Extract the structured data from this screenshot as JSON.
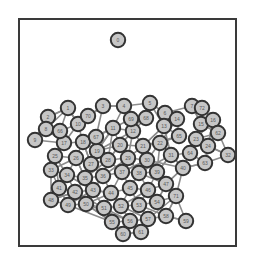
{
  "figure": {
    "type": "network-graph",
    "title": "",
    "background_color": "#ffffff",
    "frame": {
      "name": "plot-border",
      "x": 19,
      "y": 19,
      "width": 217,
      "height": 227,
      "stroke_color": "#3a3a3a",
      "stroke_width": 2,
      "fill": "none"
    },
    "style": {
      "node_fill": "#c6c6c6",
      "node_stroke": "#333333",
      "node_stroke_width": 2,
      "node_radius": 7.2,
      "edge_color": "#8d8d8d",
      "edge_width": 1.6,
      "label_color": "#5a5a5a",
      "label_font_size": 5
    },
    "summary": {
      "node_count": 73,
      "edge_count": 214,
      "isolated_nodes": 1,
      "layout": "force-directed",
      "description": "Dense force-directed network with one isolated node near the top and a large connected hairball cluster occupying the lower two-thirds of the frame."
    }
  },
  "chart_data": {
    "type": "scatter",
    "title": "",
    "xlabel": "",
    "ylabel": "",
    "xlim": [
      19,
      236
    ],
    "ylim": [
      19,
      246
    ],
    "grid": false,
    "legend": null,
    "nodes": [
      {
        "id": 1,
        "label": "0",
        "x": 118,
        "y": 40
      },
      {
        "id": 2,
        "label": "1",
        "x": 68,
        "y": 108
      },
      {
        "id": 3,
        "label": "2",
        "x": 48,
        "y": 117
      },
      {
        "id": 4,
        "label": "3",
        "x": 103,
        "y": 106
      },
      {
        "id": 5,
        "label": "4",
        "x": 124,
        "y": 106
      },
      {
        "id": 6,
        "label": "5",
        "x": 150,
        "y": 103
      },
      {
        "id": 7,
        "label": "6",
        "x": 165,
        "y": 113
      },
      {
        "id": 8,
        "label": "7",
        "x": 192,
        "y": 106
      },
      {
        "id": 9,
        "label": "8",
        "x": 46,
        "y": 129
      },
      {
        "id": 10,
        "label": "9",
        "x": 35,
        "y": 140
      },
      {
        "id": 11,
        "label": "10",
        "x": 78,
        "y": 124
      },
      {
        "id": 12,
        "label": "11",
        "x": 113,
        "y": 128
      },
      {
        "id": 13,
        "label": "12",
        "x": 133,
        "y": 131
      },
      {
        "id": 14,
        "label": "13",
        "x": 164,
        "y": 126
      },
      {
        "id": 15,
        "label": "14",
        "x": 177,
        "y": 119
      },
      {
        "id": 16,
        "label": "15",
        "x": 201,
        "y": 124
      },
      {
        "id": 17,
        "label": "16",
        "x": 213,
        "y": 120
      },
      {
        "id": 18,
        "label": "17",
        "x": 64,
        "y": 143
      },
      {
        "id": 19,
        "label": "18",
        "x": 83,
        "y": 142
      },
      {
        "id": 20,
        "label": "19",
        "x": 97,
        "y": 151
      },
      {
        "id": 21,
        "label": "20",
        "x": 120,
        "y": 145
      },
      {
        "id": 22,
        "label": "21",
        "x": 143,
        "y": 146
      },
      {
        "id": 23,
        "label": "22",
        "x": 160,
        "y": 143
      },
      {
        "id": 24,
        "label": "23",
        "x": 196,
        "y": 139
      },
      {
        "id": 25,
        "label": "24",
        "x": 208,
        "y": 146
      },
      {
        "id": 26,
        "label": "25",
        "x": 55,
        "y": 156
      },
      {
        "id": 27,
        "label": "26",
        "x": 76,
        "y": 158
      },
      {
        "id": 28,
        "label": "27",
        "x": 91,
        "y": 164
      },
      {
        "id": 29,
        "label": "28",
        "x": 108,
        "y": 160
      },
      {
        "id": 30,
        "label": "29",
        "x": 128,
        "y": 158
      },
      {
        "id": 31,
        "label": "30",
        "x": 147,
        "y": 160
      },
      {
        "id": 32,
        "label": "31",
        "x": 171,
        "y": 155
      },
      {
        "id": 33,
        "label": "32",
        "x": 228,
        "y": 155
      },
      {
        "id": 34,
        "label": "33",
        "x": 51,
        "y": 170
      },
      {
        "id": 35,
        "label": "34",
        "x": 67,
        "y": 175
      },
      {
        "id": 36,
        "label": "35",
        "x": 85,
        "y": 178
      },
      {
        "id": 37,
        "label": "36",
        "x": 103,
        "y": 176
      },
      {
        "id": 38,
        "label": "37",
        "x": 122,
        "y": 172
      },
      {
        "id": 39,
        "label": "38",
        "x": 139,
        "y": 173
      },
      {
        "id": 40,
        "label": "39",
        "x": 157,
        "y": 172
      },
      {
        "id": 41,
        "label": "40",
        "x": 183,
        "y": 168
      },
      {
        "id": 42,
        "label": "41",
        "x": 59,
        "y": 188
      },
      {
        "id": 43,
        "label": "42",
        "x": 75,
        "y": 192
      },
      {
        "id": 44,
        "label": "43",
        "x": 93,
        "y": 190
      },
      {
        "id": 45,
        "label": "44",
        "x": 111,
        "y": 193
      },
      {
        "id": 46,
        "label": "45",
        "x": 130,
        "y": 188
      },
      {
        "id": 47,
        "label": "46",
        "x": 148,
        "y": 190
      },
      {
        "id": 48,
        "label": "47",
        "x": 166,
        "y": 184
      },
      {
        "id": 49,
        "label": "48",
        "x": 51,
        "y": 200
      },
      {
        "id": 50,
        "label": "49",
        "x": 68,
        "y": 205
      },
      {
        "id": 51,
        "label": "50",
        "x": 86,
        "y": 204
      },
      {
        "id": 52,
        "label": "51",
        "x": 104,
        "y": 208
      },
      {
        "id": 53,
        "label": "52",
        "x": 121,
        "y": 206
      },
      {
        "id": 54,
        "label": "53",
        "x": 139,
        "y": 205
      },
      {
        "id": 55,
        "label": "54",
        "x": 157,
        "y": 202
      },
      {
        "id": 56,
        "label": "55",
        "x": 112,
        "y": 222
      },
      {
        "id": 57,
        "label": "56",
        "x": 130,
        "y": 221
      },
      {
        "id": 58,
        "label": "57",
        "x": 148,
        "y": 219
      },
      {
        "id": 59,
        "label": "58",
        "x": 166,
        "y": 216
      },
      {
        "id": 60,
        "label": "59",
        "x": 186,
        "y": 221
      },
      {
        "id": 61,
        "label": "60",
        "x": 123,
        "y": 234
      },
      {
        "id": 62,
        "label": "61",
        "x": 141,
        "y": 232
      },
      {
        "id": 63,
        "label": "62",
        "x": 218,
        "y": 133
      },
      {
        "id": 64,
        "label": "63",
        "x": 205,
        "y": 163
      },
      {
        "id": 65,
        "label": "64",
        "x": 190,
        "y": 153
      },
      {
        "id": 66,
        "label": "65",
        "x": 179,
        "y": 136
      },
      {
        "id": 67,
        "label": "66",
        "x": 60,
        "y": 131
      },
      {
        "id": 68,
        "label": "67",
        "x": 96,
        "y": 137
      },
      {
        "id": 69,
        "label": "68",
        "x": 146,
        "y": 118
      },
      {
        "id": 70,
        "label": "69",
        "x": 131,
        "y": 119
      },
      {
        "id": 71,
        "label": "70",
        "x": 88,
        "y": 116
      },
      {
        "id": 72,
        "label": "71",
        "x": 176,
        "y": 196
      },
      {
        "id": 73,
        "label": "72",
        "x": 202,
        "y": 108
      }
    ],
    "edges": [
      [
        2,
        3
      ],
      [
        2,
        9
      ],
      [
        3,
        9
      ],
      [
        9,
        10
      ],
      [
        2,
        67
      ],
      [
        67,
        11
      ],
      [
        11,
        71
      ],
      [
        71,
        4
      ],
      [
        4,
        5
      ],
      [
        5,
        6
      ],
      [
        6,
        7
      ],
      [
        7,
        8
      ],
      [
        8,
        73
      ],
      [
        8,
        16
      ],
      [
        16,
        17
      ],
      [
        17,
        63
      ],
      [
        63,
        25
      ],
      [
        25,
        33
      ],
      [
        25,
        24
      ],
      [
        24,
        16
      ],
      [
        14,
        15
      ],
      [
        15,
        7
      ],
      [
        14,
        23
      ],
      [
        23,
        32
      ],
      [
        32,
        41
      ],
      [
        41,
        64
      ],
      [
        64,
        25
      ],
      [
        66,
        14
      ],
      [
        66,
        23
      ],
      [
        5,
        70
      ],
      [
        70,
        69
      ],
      [
        69,
        6
      ],
      [
        70,
        12
      ],
      [
        12,
        13
      ],
      [
        13,
        22
      ],
      [
        22,
        23
      ],
      [
        12,
        21
      ],
      [
        21,
        22
      ],
      [
        11,
        18
      ],
      [
        18,
        19
      ],
      [
        19,
        20
      ],
      [
        20,
        21
      ],
      [
        19,
        68
      ],
      [
        68,
        12
      ],
      [
        68,
        20
      ],
      [
        26,
        27
      ],
      [
        27,
        28
      ],
      [
        28,
        29
      ],
      [
        29,
        30
      ],
      [
        30,
        31
      ],
      [
        31,
        40
      ],
      [
        40,
        32
      ],
      [
        26,
        34
      ],
      [
        34,
        35
      ],
      [
        35,
        36
      ],
      [
        36,
        37
      ],
      [
        37,
        38
      ],
      [
        38,
        39
      ],
      [
        39,
        40
      ],
      [
        35,
        42
      ],
      [
        42,
        43
      ],
      [
        43,
        44
      ],
      [
        44,
        45
      ],
      [
        45,
        46
      ],
      [
        46,
        47
      ],
      [
        47,
        48
      ],
      [
        48,
        41
      ],
      [
        42,
        49
      ],
      [
        49,
        50
      ],
      [
        50,
        51
      ],
      [
        51,
        52
      ],
      [
        52,
        53
      ],
      [
        53,
        54
      ],
      [
        54,
        55
      ],
      [
        55,
        48
      ],
      [
        52,
        56
      ],
      [
        56,
        57
      ],
      [
        57,
        58
      ],
      [
        58,
        59
      ],
      [
        59,
        60
      ],
      [
        56,
        61
      ],
      [
        61,
        62
      ],
      [
        62,
        57
      ],
      [
        18,
        26
      ],
      [
        26,
        42
      ],
      [
        34,
        49
      ],
      [
        20,
        29
      ],
      [
        21,
        30
      ],
      [
        22,
        31
      ],
      [
        29,
        37
      ],
      [
        30,
        38
      ],
      [
        31,
        39
      ],
      [
        37,
        44
      ],
      [
        38,
        45
      ],
      [
        39,
        46
      ],
      [
        44,
        51
      ],
      [
        45,
        52
      ],
      [
        46,
        53
      ],
      [
        47,
        54
      ],
      [
        13,
        30
      ],
      [
        13,
        21
      ],
      [
        23,
        31
      ],
      [
        23,
        40
      ],
      [
        32,
        40
      ],
      [
        40,
        48
      ],
      [
        41,
        48
      ],
      [
        64,
        41
      ],
      [
        65,
        32
      ],
      [
        65,
        41
      ],
      [
        65,
        24
      ],
      [
        19,
        28
      ],
      [
        27,
        35
      ],
      [
        28,
        36
      ],
      [
        36,
        43
      ],
      [
        43,
        50
      ],
      [
        51,
        56
      ],
      [
        53,
        57
      ],
      [
        54,
        58
      ],
      [
        55,
        59
      ],
      [
        48,
        72
      ],
      [
        72,
        59
      ],
      [
        72,
        55
      ],
      [
        20,
        38
      ],
      [
        21,
        39
      ],
      [
        12,
        29
      ],
      [
        5,
        12
      ],
      [
        6,
        13
      ],
      [
        4,
        11
      ],
      [
        3,
        10
      ],
      [
        10,
        18
      ],
      [
        18,
        34
      ],
      [
        27,
        34
      ],
      [
        29,
        38
      ],
      [
        30,
        39
      ],
      [
        31,
        48
      ],
      [
        22,
        40
      ],
      [
        14,
        32
      ],
      [
        15,
        66
      ],
      [
        66,
        22
      ],
      [
        17,
        24
      ],
      [
        63,
        16
      ],
      [
        73,
        16
      ],
      [
        11,
        19
      ],
      [
        68,
        28
      ],
      [
        4,
        68
      ],
      [
        71,
        11
      ],
      [
        2,
        11
      ],
      [
        9,
        18
      ],
      [
        26,
        35
      ],
      [
        34,
        42
      ],
      [
        49,
        43
      ],
      [
        50,
        44
      ],
      [
        45,
        53
      ],
      [
        46,
        54
      ],
      [
        47,
        55
      ],
      [
        37,
        45
      ],
      [
        38,
        46
      ],
      [
        39,
        47
      ],
      [
        36,
        44
      ],
      [
        35,
        43
      ],
      [
        28,
        37
      ],
      [
        27,
        36
      ],
      [
        52,
        57
      ],
      [
        53,
        58
      ],
      [
        54,
        59
      ],
      [
        56,
        52
      ],
      [
        61,
        56
      ],
      [
        62,
        61
      ],
      [
        58,
        72
      ],
      [
        59,
        72
      ],
      [
        41,
        72
      ],
      [
        64,
        65
      ],
      [
        25,
        64
      ],
      [
        24,
        65
      ],
      [
        33,
        25
      ],
      [
        17,
        25
      ],
      [
        63,
        24
      ],
      [
        7,
        15
      ],
      [
        6,
        14
      ],
      [
        69,
        13
      ],
      [
        70,
        13
      ],
      [
        12,
        20
      ],
      [
        21,
        29
      ],
      [
        22,
        30
      ],
      [
        31,
        38
      ],
      [
        32,
        39
      ],
      [
        40,
        47
      ],
      [
        48,
        55
      ],
      [
        19,
        27
      ],
      [
        20,
        28
      ],
      [
        29,
        36
      ],
      [
        30,
        37
      ],
      [
        12,
        19
      ],
      [
        13,
        20
      ],
      [
        14,
        22
      ],
      [
        15,
        23
      ],
      [
        16,
        24
      ],
      [
        17,
        33
      ],
      [
        23,
        41
      ],
      [
        31,
        41
      ],
      [
        39,
        48
      ],
      [
        44,
        52
      ],
      [
        45,
        51
      ],
      [
        43,
        49
      ],
      [
        42,
        50
      ],
      [
        51,
        57
      ],
      [
        50,
        56
      ],
      [
        58,
        62
      ],
      [
        57,
        61
      ],
      [
        60,
        59
      ],
      [
        60,
        72
      ],
      [
        21,
        13
      ],
      [
        30,
        22
      ],
      [
        38,
        31
      ],
      [
        46,
        39
      ],
      [
        53,
        47
      ],
      [
        20,
        12
      ],
      [
        28,
        19
      ],
      [
        36,
        27
      ],
      [
        44,
        35
      ],
      [
        52,
        43
      ],
      [
        56,
        51
      ],
      [
        29,
        21
      ],
      [
        37,
        29
      ],
      [
        45,
        44
      ],
      [
        22,
        14
      ],
      [
        41,
        32
      ],
      [
        64,
        33
      ],
      [
        25,
        17
      ],
      [
        16,
        8
      ],
      [
        73,
        8
      ],
      [
        11,
        2
      ],
      [
        10,
        9
      ],
      [
        3,
        2
      ],
      [
        5,
        4
      ],
      [
        70,
        5
      ],
      [
        69,
        70
      ]
    ]
  }
}
